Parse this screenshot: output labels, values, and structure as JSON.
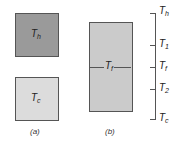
{
  "panel_a": {
    "caption": "(a)",
    "hot_block": {
      "label": "T",
      "sub": "h",
      "color": "#9a9a9a"
    },
    "cold_block": {
      "label": "T",
      "sub": "c",
      "color": "#dcdcdc"
    }
  },
  "panel_b": {
    "caption": "(b)",
    "block": {
      "label": "T",
      "sub": "f",
      "color": "#cbcbcb"
    }
  },
  "scale": {
    "ticks": [
      {
        "label": "T",
        "sub": "h"
      },
      {
        "label": "T",
        "sub": "1"
      },
      {
        "label": "T",
        "sub": "f"
      },
      {
        "label": "T",
        "sub": "2"
      },
      {
        "label": "T",
        "sub": "c"
      }
    ]
  }
}
